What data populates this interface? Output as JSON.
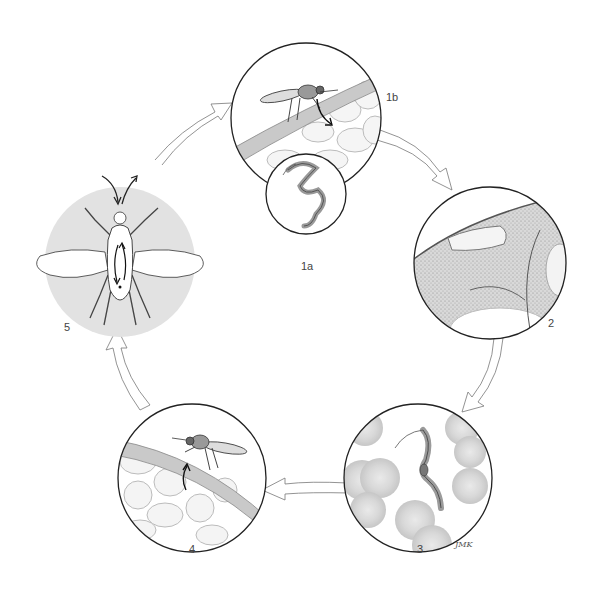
{
  "diagram": {
    "type": "life-cycle",
    "stages": [
      {
        "id": "1a",
        "label": "1a",
        "depicts": "trypanosome parasite (close-up inset)"
      },
      {
        "id": "1b",
        "label": "1b",
        "depicts": "fly biting skin, injecting parasite into tissue"
      },
      {
        "id": "2",
        "label": "2",
        "depicts": "parasite multiplying in skin tissue"
      },
      {
        "id": "3",
        "label": "3",
        "depicts": "trypanosome among red blood cells"
      },
      {
        "id": "4",
        "label": "4",
        "depicts": "fly feeding on skin, taking up parasites"
      },
      {
        "id": "5",
        "label": "5",
        "depicts": "parasite development inside fly (gut to salivary glands)"
      }
    ],
    "cycle_order": [
      "5",
      "1b",
      "2",
      "3",
      "4",
      "5"
    ],
    "signature": "JMK"
  },
  "colors": {
    "outline": "#222222",
    "stage5_bg": "#e2e2e2",
    "skin_band": "#c9c9c9",
    "blood_cell": "#d0d0d0",
    "tissue": "#d8d8d8"
  }
}
